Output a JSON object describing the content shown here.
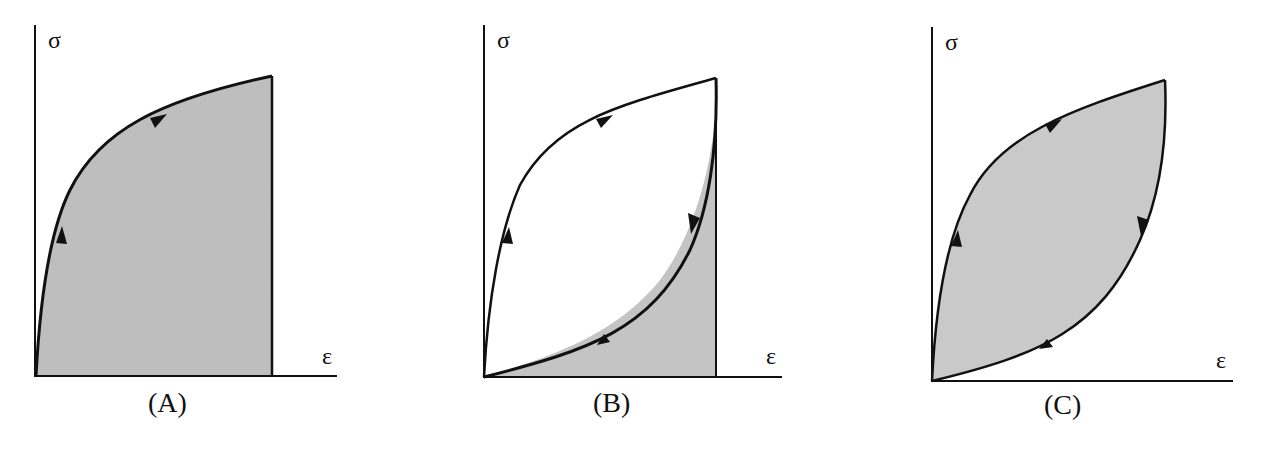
{
  "figure": {
    "fill_color": "#c9c9c9",
    "line_color": "#111111",
    "panels": [
      {
        "id": "A",
        "caption": "(A)",
        "y_axis_label": "σ",
        "x_axis_label": "ε",
        "type": "loading-only, area under curve shaded"
      },
      {
        "id": "B",
        "caption": "(B)",
        "y_axis_label": "σ",
        "x_axis_label": "ε",
        "type": "loading and unloading, area under unloading curve shaded"
      },
      {
        "id": "C",
        "caption": "(C)",
        "y_axis_label": "σ",
        "x_axis_label": "ε",
        "type": "hysteresis loop, enclosed area shaded"
      }
    ]
  }
}
